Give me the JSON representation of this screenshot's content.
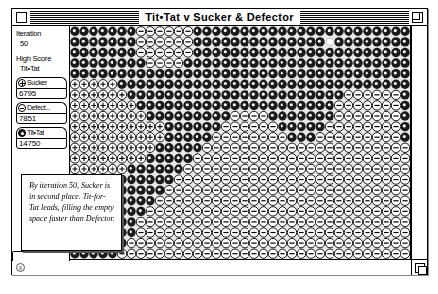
{
  "window": {
    "title": "Tit•Tat v Sucker & Defector",
    "close_icon": "close-box-icon",
    "zoom_icon": "zoom-box-icon",
    "grow_icon": "grow-box-icon"
  },
  "sidebar": {
    "iteration_label": "Iteration",
    "iteration_value": "50",
    "high_score_label": "High Score",
    "high_score_value": "Tit•Tat",
    "scores": [
      {
        "name": "Sucker",
        "value": "6795",
        "icon": "sucker-plus-chip-icon",
        "kind": "sucker"
      },
      {
        "name": "Defect...",
        "value": "7851",
        "icon": "defector-minus-chip-icon",
        "kind": "defector"
      },
      {
        "name": "Tit•Tat",
        "value": "14750",
        "icon": "titfortat-dark-chip-icon",
        "kind": "titfortat"
      }
    ]
  },
  "callout": {
    "text": "By iteration 50, Sucker is in second place. Tit-for-Tat leads, filling the empty space faster than Defector."
  },
  "scrollbars": {
    "vertical_name": "vertical-scrollbar",
    "horizontal_name": "horizontal-scrollbar",
    "corner_marker": "9"
  },
  "colors": {
    "frame": "#000000",
    "background": "#ffffff",
    "grid_empty": "#e8e8e8",
    "titfortat_fill": "#1a1a1a",
    "sucker_fill": "#ffffff",
    "defector_fill": "#ffffff"
  },
  "grid": {
    "cols": 36,
    "rows": 22,
    "legend": {
      "0": "empty-light",
      "1": "titfortat-dark-cell",
      "2": "sucker-plus-cell",
      "3": "defector-minus-cell"
    },
    "cells": [
      "111111133333311111111111111111111111",
      "111111133333311111111111111011111111",
      "111111133333311111111111111111111111",
      "111111113333111111111111111111111111",
      "111111111111111111111111111111111111",
      "222221111111111111111111111111111111",
      "222222111111111111111111111113333331",
      "222222211111111111111111111133333331",
      "222222221111111113333111111133333331",
      "222222222211111133333311111333333331",
      "222222222211111333333331113333333331",
      "222222222111113333333333333333333333",
      "222222221111133333333333333333333333",
      "222222111111333333333333333333333333",
      "222221111113333333333333333333333333",
      "222211111133333333333333333333333333",
      "222111111333333333333333333333333333",
      "221111113333333333333333333333333333",
      "211111133333333333333333333333333333",
      "111111133333333333333333333333333333",
      "111111333333333333333333333333333333",
      "111113333333333333333333333333333333"
    ]
  }
}
